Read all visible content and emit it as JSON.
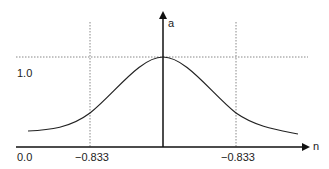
{
  "diagram": {
    "type": "gaussian-bell-curve",
    "axes": {
      "y_label": "a",
      "x_label": "n"
    },
    "labels": {
      "y_level": "1.0",
      "origin": "0.0",
      "left_mark": "−0.833",
      "right_mark": "−0.833"
    },
    "colors": {
      "curve": "#222222",
      "axis": "#111111",
      "guide": "#888888"
    }
  }
}
